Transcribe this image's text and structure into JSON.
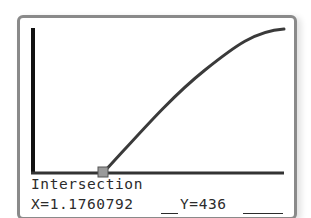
{
  "calculator_screen": {
    "result_title": "Intersection",
    "x_readout": "X=1.1760792",
    "y_readout": "Y=436"
  },
  "graph": {
    "curve_color": "#3a3a3a",
    "axis_color": "#111111",
    "marker_color": "#9a9a9a",
    "intersection_marker": {
      "x": 1.1760792,
      "y": 436
    }
  }
}
